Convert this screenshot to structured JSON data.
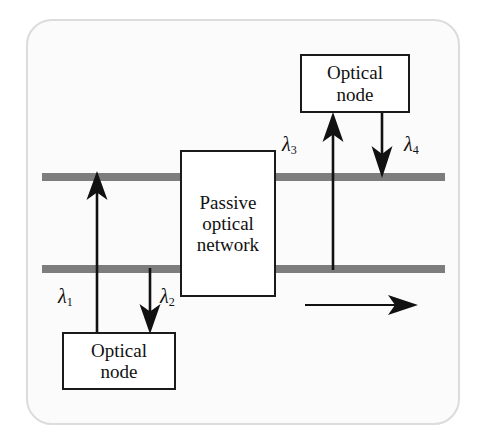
{
  "figure": {
    "background_color": "#fbfbfb",
    "frame_color": "#dcdcdc",
    "bus_color": "#7d7d7d",
    "line_color": "#1a1a1a"
  },
  "nodes": {
    "top": {
      "line1": "Optical",
      "line2": "node"
    },
    "bottom": {
      "line1": "Optical",
      "line2": "node"
    },
    "pon": {
      "line1": "Passive",
      "line2": "optical",
      "line3": "network"
    }
  },
  "wavelengths": {
    "lambda1": {
      "symbol": "λ",
      "index": "1"
    },
    "lambda2": {
      "symbol": "λ",
      "index": "2"
    },
    "lambda3": {
      "symbol": "λ",
      "index": "3"
    },
    "lambda4": {
      "symbol": "λ",
      "index": "4"
    }
  },
  "buses": {
    "upper_label": "upper-fiber-bus",
    "lower_label": "lower-fiber-bus"
  },
  "direction_arrow": {
    "label": "propagation-direction",
    "orientation": "rightward"
  }
}
